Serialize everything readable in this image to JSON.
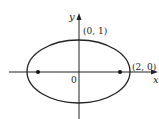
{
  "diagram": {
    "type": "ellipse-on-axes",
    "axes": {
      "x_label": "x",
      "y_label": "y",
      "origin_label": "0"
    },
    "ellipse": {
      "center": [
        0,
        0
      ],
      "semi_major": 2,
      "semi_minor": 1
    },
    "points": [
      {
        "label": "(0, 1)",
        "coords": [
          0,
          1
        ]
      },
      {
        "label": "(2, 0)",
        "coords": [
          2,
          0
        ]
      }
    ],
    "foci": [
      {
        "coords": [
          -1.732,
          0
        ]
      },
      {
        "coords": [
          1.732,
          0
        ]
      }
    ],
    "colors": {
      "stroke": "#222222",
      "background": "#ffffff"
    }
  }
}
